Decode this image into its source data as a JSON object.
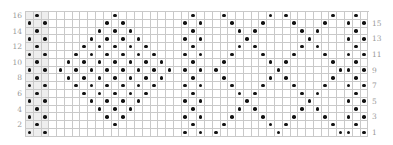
{
  "chart": {
    "rows": 16,
    "cols": 44,
    "grid_color": "#c9c9c9",
    "shade_color": "#eeeeee",
    "dot_color": "#111111",
    "label_color": "#9a9a9a",
    "left_labels": [
      "16",
      "14",
      "12",
      "10",
      "8",
      "6",
      "4",
      "2"
    ],
    "right_labels": [
      "15",
      "13",
      "11",
      "9",
      "7",
      "5",
      "3",
      "1"
    ],
    "shaded_columns": [
      0,
      1,
      2
    ],
    "symbol_legend": {
      "dot": "purl"
    }
  },
  "chart_data": {
    "type": "heatmap",
    "title": "",
    "xlabel": "",
    "ylabel": "Row",
    "rows": 16,
    "cols": 44,
    "row_labels_left": [
      16,
      14,
      12,
      10,
      8,
      6,
      4,
      2
    ],
    "row_labels_right": [
      15,
      13,
      11,
      9,
      7,
      5,
      3,
      1
    ],
    "dots_by_row": {
      "16": [
        1,
        11,
        21,
        25,
        31,
        33,
        39,
        42
      ],
      "15": [
        0,
        2,
        10,
        12,
        20,
        22,
        26,
        30,
        34,
        38,
        41,
        43
      ],
      "14": [
        1,
        9,
        11,
        13,
        21,
        27,
        29,
        35,
        37,
        42
      ],
      "13": [
        0,
        2,
        8,
        10,
        12,
        14,
        20,
        22,
        28,
        36,
        41,
        43
      ],
      "12": [
        1,
        7,
        9,
        11,
        13,
        15,
        21,
        27,
        29,
        35,
        37,
        42
      ],
      "11": [
        0,
        2,
        6,
        8,
        10,
        12,
        14,
        16,
        20,
        22,
        26,
        30,
        34,
        38,
        41,
        43
      ],
      "10": [
        1,
        5,
        7,
        9,
        11,
        13,
        15,
        17,
        21,
        25,
        31,
        33,
        39,
        42
      ],
      "9": [
        0,
        2,
        4,
        6,
        8,
        10,
        12,
        14,
        16,
        18,
        20,
        22,
        24,
        32,
        40,
        41,
        43
      ],
      "8": [
        1,
        5,
        7,
        9,
        11,
        13,
        15,
        17,
        21,
        25,
        31,
        33,
        39,
        42
      ],
      "7": [
        0,
        2,
        6,
        8,
        10,
        12,
        14,
        16,
        20,
        22,
        26,
        30,
        34,
        38,
        41,
        43
      ],
      "6": [
        1,
        7,
        9,
        11,
        13,
        15,
        21,
        27,
        29,
        35,
        37,
        42
      ],
      "5": [
        0,
        2,
        8,
        10,
        12,
        14,
        20,
        22,
        28,
        36,
        41,
        43
      ],
      "4": [
        1,
        9,
        11,
        13,
        21,
        27,
        29,
        35,
        37,
        42
      ],
      "3": [
        0,
        2,
        10,
        12,
        20,
        22,
        26,
        30,
        34,
        38,
        41,
        43
      ],
      "2": [
        1,
        11,
        21,
        25,
        31,
        33,
        39,
        42
      ],
      "1": [
        0,
        2,
        20,
        22,
        24,
        32,
        40,
        41,
        43
      ]
    }
  }
}
